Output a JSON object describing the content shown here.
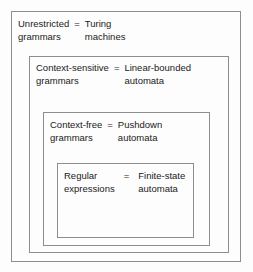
{
  "diagram": {
    "equals_symbol": "=",
    "border_color": "#8d8d8d",
    "background_color": "#fdfdfd",
    "text_color": "#1a1a1a",
    "levels": [
      {
        "id": "unrestricted",
        "grammar_line1": "Unrestricted",
        "grammar_line2": "grammars",
        "machine_line1": "Turing",
        "machine_line2": "machines"
      },
      {
        "id": "context-sensitive",
        "grammar_line1": "Context-sensitive",
        "grammar_line2": "grammars",
        "machine_line1": "Linear-bounded",
        "machine_line2": "automata"
      },
      {
        "id": "context-free",
        "grammar_line1": "Context-free",
        "grammar_line2": "grammars",
        "machine_line1": "Pushdown",
        "machine_line2": "automata"
      },
      {
        "id": "regular",
        "grammar_line1": "Regular",
        "grammar_line2": "expressions",
        "machine_line1": "Finite-state",
        "machine_line2": "automata"
      }
    ]
  }
}
